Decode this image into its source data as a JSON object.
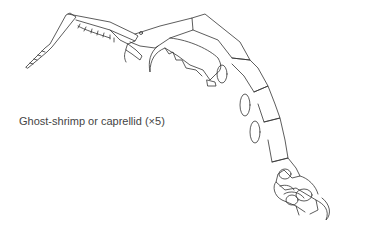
{
  "figure": {
    "caption": "Ghost-shrimp or caprellid (×5)"
  }
}
